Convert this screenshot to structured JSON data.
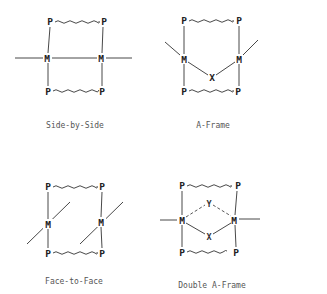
{
  "figure": {
    "panels": [
      {
        "id": "side-by-side",
        "caption": "Side-by-Side",
        "atoms": {
          "p_tl": "P",
          "p_tr": "P",
          "m_l": "M",
          "m_r": "M",
          "p_bl": "P",
          "p_br": "P"
        },
        "bridge_atoms": []
      },
      {
        "id": "a-frame",
        "caption": "A-Frame",
        "atoms": {
          "p_tl": "P",
          "p_tr": "P",
          "m_l": "M",
          "m_r": "M",
          "p_bl": "P",
          "p_br": "P"
        },
        "bridge_atoms": [
          "X"
        ]
      },
      {
        "id": "face-to-face",
        "caption": "Face-to-Face",
        "atoms": {
          "p_tl": "P",
          "p_tr": "P",
          "m_l": "M",
          "m_r": "M",
          "p_bl": "P",
          "p_br": "P"
        },
        "bridge_atoms": []
      },
      {
        "id": "double-a-frame",
        "caption": "Double A-Frame",
        "atoms": {
          "p_tl": "P",
          "p_tr": "P",
          "m_l": "M",
          "m_r": "M",
          "p_bl": "P",
          "p_br": "P"
        },
        "bridge_atoms": [
          "Y",
          "X"
        ]
      }
    ],
    "colors": {
      "ink": "#333333",
      "background": "#ffffff",
      "caption": "#555555"
    }
  }
}
